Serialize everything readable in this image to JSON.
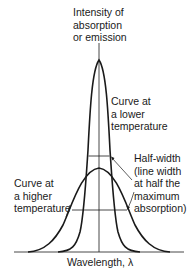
{
  "diagram": {
    "y_axis_label": [
      "Intensity of",
      "absorption",
      "or emission"
    ],
    "x_axis_label": "Wavelength, λ",
    "labels": {
      "lower_temp": [
        "Curve at",
        "a lower",
        "temperature"
      ],
      "higher_temp": [
        "Curve at",
        "a higher",
        "temperature"
      ],
      "half_width": [
        "Half-width",
        "(line width",
        "at half the",
        "maximum",
        "absorption)"
      ]
    },
    "curves": [
      {
        "name": "lower-temperature",
        "peak_y": 60,
        "half_max_y": 156,
        "half_width_px": 22
      },
      {
        "name": "higher-temperature",
        "peak_y": 168,
        "half_max_y": 210,
        "half_width_px": 56
      }
    ],
    "colors": {
      "line": "#1a1a1a",
      "background": "#ffffff"
    }
  }
}
